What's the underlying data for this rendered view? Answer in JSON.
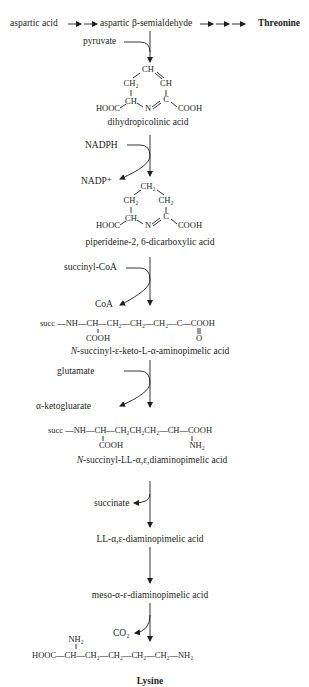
{
  "top_row": {
    "start": "aspartic acid",
    "intermediate": "aspartic β-semialdehyde",
    "branch_product": "Threonine"
  },
  "steps": [
    {
      "cosubstrate_in": "pyruvate",
      "cosubstrate_out": "",
      "product": "dihydropicolinic acid",
      "structure": {
        "top": "CH",
        "left": "CH₂",
        "right": "CH",
        "ring_left": "CH",
        "ring_n": "N",
        "ring_right": "C",
        "left_group": "HOOC",
        "right_group": "COOH"
      }
    },
    {
      "cosubstrate_in": "NADPH",
      "cosubstrate_out": "NADP⁺",
      "product": "piperideine-2, 6-dicarboxylic acid",
      "structure": {
        "top": "CH₂",
        "left": "CH₂",
        "right": "CH₂",
        "ring_left": "CH",
        "ring_n": "N",
        "ring_right": "C",
        "left_group": "HOOC",
        "right_group": "COOH"
      }
    },
    {
      "cosubstrate_in": "succinyl-CoA",
      "cosubstrate_out": "CoA",
      "product": "N-succinyl-ε-keto-L-α-aminopimelic acid",
      "structure": {
        "main": "succ —NH—CH—CH₂—CH₂—CH₂—C—COOH",
        "below_left": "COOH",
        "below_right": "O"
      }
    },
    {
      "cosubstrate_in": "glutamate",
      "cosubstrate_out": "α-ketogluarate",
      "product": "N-succinyl-LL-α,ε,diaminopimelic acid",
      "structure": {
        "main": "succ —NH—CH—CH₂CH₂CH₂—CH—COOH",
        "below_left": "COOH",
        "below_right": "NH₂"
      }
    },
    {
      "cosubstrate_in": "",
      "cosubstrate_out": "succinate",
      "product": "LL-α,ε-diaminopimelic acid"
    },
    {
      "cosubstrate_in": "",
      "cosubstrate_out": "",
      "product": "meso-α-ε-diaminopimelic acid"
    },
    {
      "cosubstrate_in": "",
      "cosubstrate_out": "CO₂",
      "product": "Lysine",
      "structure": {
        "main": "HOOC—CH—CH₂—CH₂—CH₂—CH₂—NH₂",
        "above": "NH₂"
      }
    }
  ]
}
